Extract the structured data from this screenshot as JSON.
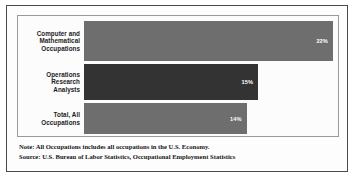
{
  "chart_data": {
    "type": "bar",
    "orientation": "horizontal",
    "title": "",
    "xlabel": "",
    "ylabel": "",
    "grid": false,
    "legend": null,
    "xlim": [
      0,
      25
    ],
    "categories": [
      "Computer and Mathematical Occupations",
      "Operations Research Analysts",
      "Total, All Occupations"
    ],
    "values": [
      22,
      15,
      14
    ],
    "value_labels": [
      "22%",
      "15%",
      "14%"
    ],
    "bar_colors": [
      "#6e6e6e",
      "#333333",
      "#6e6e6e"
    ],
    "annotations": [
      "Note: All Occupations includes all occupations in the U.S. Economy.",
      "Source: U.S. Bureau of Labor Statistics, Occupational Employment Statistics"
    ]
  },
  "figure": {
    "frame_color": "#4a4a4a",
    "plot_border_color": "#9a9a9a",
    "plot_background": "#fcfcfc"
  },
  "bars": [
    {
      "label_line1": "Computer and",
      "label_line2": "Mathematical",
      "label_line3": "Occupations",
      "value_label": "22%",
      "width_pct": "98%",
      "color": "#6e6e6e"
    },
    {
      "label_line1": "Operations",
      "label_line2": "Research",
      "label_line3": "Analysts",
      "value_label": "15%",
      "width_pct": "68.5%",
      "color": "#333333"
    },
    {
      "label_line1": "Total, All",
      "label_line2": "Occupations",
      "label_line3": "",
      "value_label": "14%",
      "width_pct": "64%",
      "color": "#6e6e6e"
    }
  ],
  "footnotes": {
    "note": "Note: All Occupations includes all occupations in the U.S. Economy.",
    "source": "Source: U.S. Bureau of Labor Statistics, Occupational Employment Statistics"
  }
}
